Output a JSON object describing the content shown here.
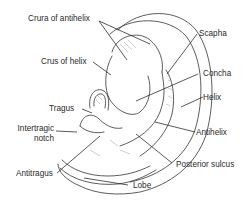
{
  "figure": {
    "colors": {
      "line": "#333333",
      "shading": "#9a9a9a",
      "background": "#ffffff",
      "text": "#2a2a2a"
    },
    "labels": {
      "crura_of_antihelix": "Crura of antihelix",
      "crus_of_helix": "Crus of helix",
      "tragus": "Tragus",
      "intertragic_notch_line1": "Intertragic",
      "intertragic_notch_line2": "notch",
      "antitragus": "Antitragus",
      "scapha": "Scapha",
      "concha": "Concha",
      "helix": "Helix",
      "antihelix": "Antihelix",
      "posterior_sulcus": "Posterior sulcus",
      "lobe": "Lobe"
    }
  }
}
